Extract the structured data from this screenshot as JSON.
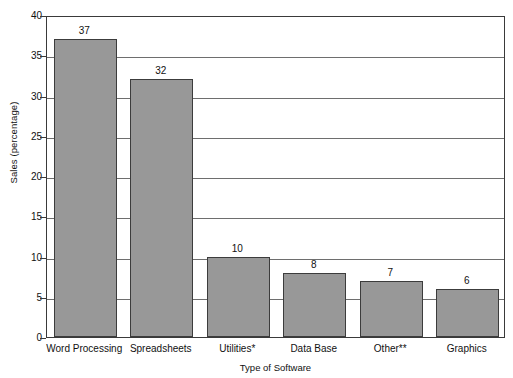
{
  "chart_data": {
    "type": "bar",
    "title": "",
    "xlabel": "Type of Software",
    "ylabel": "Sales (percentage)",
    "categories": [
      "Word Processing",
      "Spreadsheets",
      "Utilities*",
      "Data Base",
      "Other**",
      "Graphics"
    ],
    "values": [
      37,
      32,
      10,
      8,
      7,
      6
    ],
    "value_labels": [
      "37",
      "32",
      "10",
      "8",
      "7",
      "6"
    ],
    "ylim": [
      0,
      40
    ],
    "yticks": [
      0,
      5,
      10,
      15,
      20,
      25,
      30,
      35,
      40
    ],
    "ytick_labels": [
      "0",
      "5",
      "10",
      "15",
      "20",
      "25",
      "30",
      "35",
      "40"
    ],
    "grid": "horizontal",
    "legend": "none",
    "bar_color": "#989898",
    "bar_edge_color": "#3c3c3c",
    "gridline_color": "#6e6e6e",
    "axis_color": "#3a3a3a",
    "background_color": "#ffffff"
  }
}
